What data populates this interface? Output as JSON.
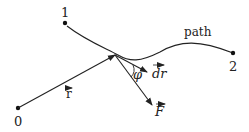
{
  "diagram": {
    "points": [
      {
        "id": "origin",
        "label": "0"
      },
      {
        "id": "start",
        "label": "1"
      },
      {
        "id": "end",
        "label": "2"
      }
    ],
    "path_label": "path",
    "vectors": {
      "position": {
        "label": "r"
      },
      "displacement": {
        "label": "dr"
      },
      "force": {
        "label": "F"
      }
    },
    "angle_label": "φ",
    "colors": {
      "stroke": "#222222",
      "background": "#ffffff"
    }
  }
}
